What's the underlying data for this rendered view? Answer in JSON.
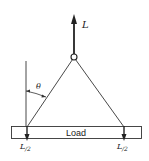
{
  "diagram": {
    "lift_force_label": "L",
    "angle_label": "θ",
    "load_label": "Load",
    "left_reaction": {
      "numerator": "L",
      "denominator": "/2"
    },
    "right_reaction": {
      "numerator": "L",
      "denominator": "/2"
    }
  }
}
